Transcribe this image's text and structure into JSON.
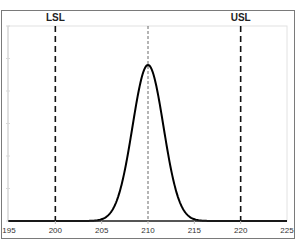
{
  "chart_data": {
    "type": "line",
    "title": "",
    "xlabel": "",
    "ylabel": "",
    "xlim": [
      195,
      225
    ],
    "x_ticks": [
      195,
      200,
      205,
      210,
      215,
      220,
      225
    ],
    "x_tick_labels": [
      "195",
      "200",
      "205",
      "210",
      "215",
      "220",
      "225"
    ],
    "grid": false,
    "legend": null,
    "series": [
      {
        "name": "Normal distribution",
        "distribution": "normal",
        "mean": 210,
        "sigma": 1.67,
        "x": [
          204,
          205,
          206,
          207,
          208,
          209,
          210,
          211,
          212,
          213,
          214,
          215,
          216
        ],
        "y_relative": [
          0.002,
          0.011,
          0.057,
          0.198,
          0.488,
          0.836,
          1.0,
          0.836,
          0.488,
          0.198,
          0.057,
          0.011,
          0.002
        ],
        "color": "#000000"
      }
    ],
    "reference_lines": [
      {
        "name": "LSL",
        "label": "LSL",
        "x": 200,
        "style": "dashed"
      },
      {
        "name": "Center",
        "label": "",
        "x": 210,
        "style": "dotted"
      },
      {
        "name": "USL",
        "label": "USL",
        "x": 220,
        "style": "dashed"
      }
    ]
  },
  "labels": {
    "lsl": "LSL",
    "usl": "USL",
    "ticks": [
      "195",
      "200",
      "205",
      "210",
      "215",
      "220",
      "225"
    ]
  }
}
